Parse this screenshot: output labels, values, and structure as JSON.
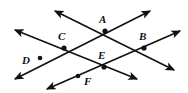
{
  "diagram": {
    "type": "line-intersection-diagram",
    "canvas": {
      "width": 188,
      "height": 93
    },
    "colors": {
      "background": "#ffffff",
      "stroke": "#111111",
      "label": "#111111",
      "point": "#111111"
    },
    "style": {
      "line_width": 1.6,
      "point_radius": 2.6,
      "arrowhead": "solid-filled-triangle"
    },
    "labels": [
      {
        "id": "A",
        "text": "A",
        "x": 99,
        "y": 14
      },
      {
        "id": "B",
        "text": "B",
        "x": 139,
        "y": 31
      },
      {
        "id": "C",
        "text": "C",
        "x": 58,
        "y": 31
      },
      {
        "id": "D",
        "text": "D",
        "x": 22,
        "y": 55
      },
      {
        "id": "E",
        "text": "E",
        "x": 98,
        "y": 50
      },
      {
        "id": "F",
        "text": "F",
        "x": 84,
        "y": 76
      }
    ],
    "points": [
      {
        "id": "A",
        "x": 105,
        "y": 31,
        "kind": "intersection"
      },
      {
        "id": "B",
        "x": 144,
        "y": 48,
        "kind": "intersection"
      },
      {
        "id": "C",
        "x": 64,
        "y": 48,
        "kind": "intersection"
      },
      {
        "id": "D",
        "x": 40,
        "y": 58,
        "kind": "on-line"
      },
      {
        "id": "E",
        "x": 104,
        "y": 67,
        "kind": "intersection"
      },
      {
        "id": "F",
        "x": 78,
        "y": 76,
        "kind": "on-line"
      }
    ],
    "lines": [
      {
        "id": "line-D-C-A",
        "name": "line-through-D-C-A",
        "from": {
          "x": 15,
          "y": 79
        },
        "to": {
          "x": 150,
          "y": 11
        },
        "arrows": "both",
        "through": [
          "D",
          "C",
          "A"
        ]
      },
      {
        "id": "line-C-A-arrow",
        "name": "line-through-C-A-B-upper",
        "from": {
          "x": 55,
          "y": 11
        },
        "to": {
          "x": 174,
          "y": 70
        },
        "arrows": "both",
        "through": [
          "A",
          "B"
        ]
      },
      {
        "id": "line-C-E",
        "name": "line-through-C-E",
        "from": {
          "x": 15,
          "y": 30
        },
        "to": {
          "x": 137,
          "y": 79
        },
        "arrows": "both",
        "through": [
          "C",
          "E"
        ]
      },
      {
        "id": "line-F-E-B",
        "name": "line-through-F-E-B",
        "from": {
          "x": 47,
          "y": 89
        },
        "to": {
          "x": 180,
          "y": 31
        },
        "arrows": "both",
        "through": [
          "F",
          "E",
          "B"
        ]
      }
    ]
  }
}
